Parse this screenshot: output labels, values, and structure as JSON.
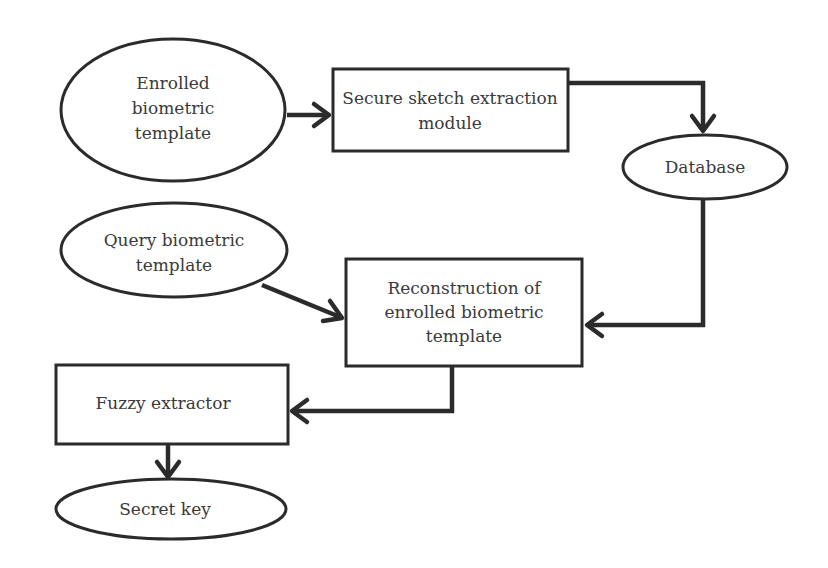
{
  "diagram": {
    "type": "flowchart",
    "nodes": {
      "enrolled": {
        "shape": "ellipse",
        "lines": [
          "Enrolled",
          "biometric",
          "template"
        ]
      },
      "secure": {
        "shape": "rectangle",
        "lines": [
          "Secure sketch extraction",
          "module"
        ]
      },
      "database": {
        "shape": "ellipse",
        "lines": [
          "Database"
        ]
      },
      "query": {
        "shape": "ellipse",
        "lines": [
          "Query biometric",
          "template"
        ]
      },
      "reconstruction": {
        "shape": "rectangle",
        "lines": [
          "Reconstruction of",
          "enrolled biometric",
          "template"
        ]
      },
      "fuzzy": {
        "shape": "rectangle",
        "lines": [
          "Fuzzy extractor"
        ]
      },
      "secret": {
        "shape": "ellipse",
        "lines": [
          "Secret key"
        ]
      }
    },
    "edges": [
      {
        "from": "enrolled",
        "to": "secure"
      },
      {
        "from": "secure",
        "to": "database"
      },
      {
        "from": "database",
        "to": "reconstruction"
      },
      {
        "from": "query",
        "to": "reconstruction"
      },
      {
        "from": "reconstruction",
        "to": "fuzzy"
      },
      {
        "from": "fuzzy",
        "to": "secret"
      }
    ],
    "colors": {
      "stroke": "#2b2b2b",
      "text": "#3a3a3a",
      "background": "#ffffff"
    }
  }
}
